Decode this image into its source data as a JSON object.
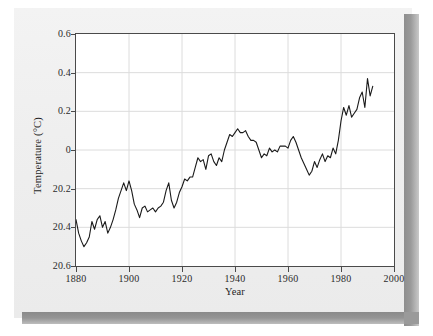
{
  "figure": {
    "background_color": "#efefef",
    "plot_background_color": "#ffffff",
    "frame_color": "#4a4a4a",
    "line_color": "#1a1a1a",
    "grid_color": "#dcdcdc",
    "shadow_color": "#8e8e8e"
  },
  "chart_data": {
    "type": "line",
    "title": "",
    "subtitle": "",
    "xlabel": "Year",
    "ylabel": "Temperature (°C)",
    "xlim": [
      1880,
      2000
    ],
    "ylim": [
      -0.6,
      0.6
    ],
    "xticks": [
      1880,
      1900,
      1920,
      1940,
      1960,
      1980,
      2000
    ],
    "xtick_labels": [
      "1880",
      "1900",
      "1920",
      "1940",
      "1960",
      "1980",
      "2000"
    ],
    "yticks": [
      0.6,
      0.4,
      0.2,
      0,
      -0.2,
      -0.4,
      -0.6
    ],
    "ytick_labels": [
      "0.6",
      "0.4",
      "0.2",
      "0",
      "20.2",
      "20.4",
      "20.6"
    ],
    "grid": true,
    "legend": null,
    "annotations": [],
    "series": [
      {
        "name": "Global temperature anomaly",
        "x": [
          1880,
          1881,
          1882,
          1883,
          1884,
          1885,
          1886,
          1887,
          1888,
          1889,
          1890,
          1891,
          1892,
          1893,
          1894,
          1895,
          1896,
          1897,
          1898,
          1899,
          1900,
          1901,
          1902,
          1903,
          1904,
          1905,
          1906,
          1907,
          1908,
          1909,
          1910,
          1911,
          1912,
          1913,
          1914,
          1915,
          1916,
          1917,
          1918,
          1919,
          1920,
          1921,
          1922,
          1923,
          1924,
          1925,
          1926,
          1927,
          1928,
          1929,
          1930,
          1931,
          1932,
          1933,
          1934,
          1935,
          1936,
          1937,
          1938,
          1939,
          1940,
          1941,
          1942,
          1943,
          1944,
          1945,
          1946,
          1947,
          1948,
          1949,
          1950,
          1951,
          1952,
          1953,
          1954,
          1955,
          1956,
          1957,
          1958,
          1959,
          1960,
          1961,
          1962,
          1963,
          1964,
          1965,
          1966,
          1967,
          1968,
          1969,
          1970,
          1971,
          1972,
          1973,
          1974,
          1975,
          1976,
          1977,
          1978,
          1979,
          1980,
          1981,
          1982,
          1983,
          1984,
          1985,
          1986,
          1987,
          1988,
          1989,
          1990,
          1991,
          1992
        ],
        "values": [
          -0.36,
          -0.43,
          -0.47,
          -0.5,
          -0.48,
          -0.45,
          -0.37,
          -0.41,
          -0.36,
          -0.34,
          -0.4,
          -0.37,
          -0.43,
          -0.4,
          -0.36,
          -0.31,
          -0.25,
          -0.21,
          -0.17,
          -0.21,
          -0.16,
          -0.21,
          -0.28,
          -0.31,
          -0.35,
          -0.3,
          -0.29,
          -0.32,
          -0.31,
          -0.3,
          -0.32,
          -0.3,
          -0.29,
          -0.27,
          -0.21,
          -0.17,
          -0.26,
          -0.3,
          -0.27,
          -0.22,
          -0.19,
          -0.15,
          -0.16,
          -0.14,
          -0.14,
          -0.09,
          -0.04,
          -0.06,
          -0.05,
          -0.1,
          -0.03,
          -0.02,
          -0.06,
          -0.08,
          -0.04,
          -0.06,
          0.0,
          0.04,
          0.08,
          0.07,
          0.09,
          0.11,
          0.09,
          0.09,
          0.1,
          0.07,
          0.05,
          0.05,
          0.04,
          0.0,
          -0.04,
          -0.02,
          -0.03,
          0.01,
          -0.01,
          0.0,
          -0.01,
          0.02,
          0.02,
          0.02,
          0.01,
          0.05,
          0.07,
          0.04,
          0.0,
          -0.04,
          -0.07,
          -0.1,
          -0.13,
          -0.11,
          -0.06,
          -0.09,
          -0.05,
          -0.02,
          -0.06,
          -0.03,
          -0.04,
          0.01,
          -0.02,
          0.05,
          0.15,
          0.22,
          0.18,
          0.23,
          0.17,
          0.19,
          0.21,
          0.27,
          0.3,
          0.22,
          0.37,
          0.28,
          0.33
        ]
      }
    ]
  }
}
